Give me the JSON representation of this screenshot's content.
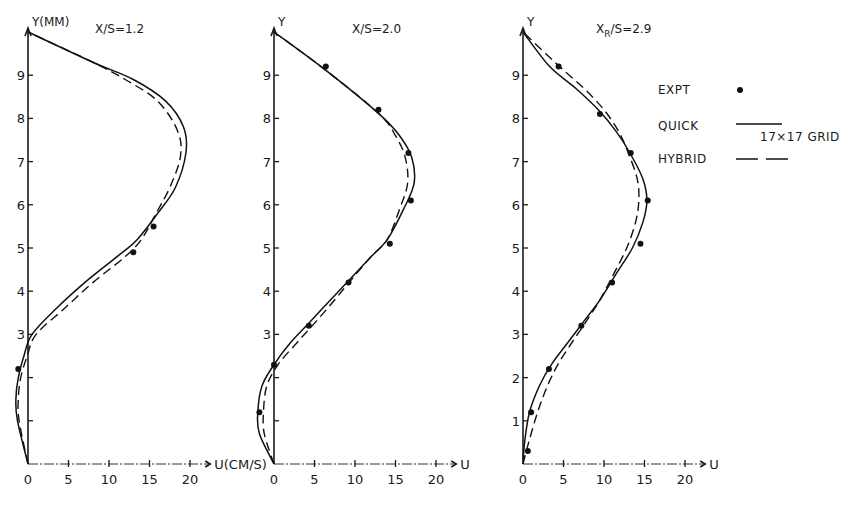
{
  "chart_data": [
    {
      "type": "line",
      "title": "X/S=1.2",
      "xlabel": "U (CM/S)",
      "ylabel": "Y(MM)",
      "x_ticks": [
        0,
        5,
        10,
        15,
        20
      ],
      "y_ticks": [
        1,
        2,
        3,
        4,
        5,
        6,
        7,
        8,
        9
      ],
      "xlim": [
        -1.5,
        22
      ],
      "ylim": [
        0,
        10
      ],
      "grid": false,
      "series": [
        {
          "name": "QUICK",
          "style": "solid",
          "points": [
            [
              0,
              0
            ],
            [
              -1.3,
              1
            ],
            [
              -1.5,
              1.5
            ],
            [
              -1.2,
              2
            ],
            [
              -0.5,
              2.5
            ],
            [
              0.5,
              3
            ],
            [
              3.5,
              3.6
            ],
            [
              7,
              4.2
            ],
            [
              11,
              4.8
            ],
            [
              13.5,
              5.2
            ],
            [
              16,
              5.8
            ],
            [
              18.2,
              6.4
            ],
            [
              19.5,
              7.2
            ],
            [
              19.2,
              7.8
            ],
            [
              17,
              8.4
            ],
            [
              13,
              8.9
            ],
            [
              8,
              9.3
            ],
            [
              0,
              10
            ]
          ]
        },
        {
          "name": "HYBRID",
          "style": "dashed",
          "points": [
            [
              0,
              0
            ],
            [
              -1.1,
              1
            ],
            [
              -1.2,
              1.5
            ],
            [
              -0.9,
              2
            ],
            [
              -0.1,
              2.5
            ],
            [
              1,
              3
            ],
            [
              4.5,
              3.6
            ],
            [
              8,
              4.2
            ],
            [
              12,
              4.8
            ],
            [
              14,
              5.2
            ],
            [
              15.8,
              5.8
            ],
            [
              17.5,
              6.4
            ],
            [
              18.8,
              7.1
            ],
            [
              18.5,
              7.7
            ],
            [
              16,
              8.4
            ],
            [
              12,
              8.9
            ],
            [
              8,
              9.3
            ],
            [
              0,
              10
            ]
          ]
        },
        {
          "name": "EXPT",
          "style": "dot",
          "points": [
            [
              -1.2,
              2.2
            ],
            [
              15.5,
              5.5
            ],
            [
              13,
              4.9
            ]
          ]
        }
      ]
    },
    {
      "type": "line",
      "title": "X/S=2.0",
      "xlabel": "U",
      "ylabel": "Y",
      "x_ticks": [
        0,
        5,
        10,
        15,
        20
      ],
      "y_ticks": [
        1,
        2,
        3,
        4,
        5,
        6,
        7,
        8,
        9
      ],
      "xlim": [
        -1.5,
        22
      ],
      "ylim": [
        0,
        10
      ],
      "grid": false,
      "series": [
        {
          "name": "QUICK",
          "style": "solid",
          "points": [
            [
              0,
              0
            ],
            [
              -1.8,
              0.7
            ],
            [
              -2,
              1.2
            ],
            [
              -1.5,
              1.8
            ],
            [
              0,
              2.3
            ],
            [
              2,
              2.8
            ],
            [
              4.5,
              3.3
            ],
            [
              7,
              3.8
            ],
            [
              9.5,
              4.3
            ],
            [
              12,
              4.8
            ],
            [
              14,
              5.2
            ],
            [
              16,
              5.9
            ],
            [
              17.3,
              6.5
            ],
            [
              17,
              7.1
            ],
            [
              15.5,
              7.6
            ],
            [
              13,
              8.1
            ],
            [
              6.5,
              9.1
            ],
            [
              0,
              10
            ]
          ]
        },
        {
          "name": "HYBRID",
          "style": "dashed",
          "points": [
            [
              0,
              0
            ],
            [
              -1.2,
              0.7
            ],
            [
              -1.3,
              1.2
            ],
            [
              -0.9,
              1.8
            ],
            [
              0.5,
              2.3
            ],
            [
              2.8,
              2.8
            ],
            [
              5.2,
              3.3
            ],
            [
              7.5,
              3.8
            ],
            [
              9.7,
              4.3
            ],
            [
              12,
              4.8
            ],
            [
              14,
              5.2
            ],
            [
              15.5,
              5.9
            ],
            [
              16.5,
              6.5
            ],
            [
              16.2,
              7.1
            ],
            [
              15,
              7.6
            ],
            [
              13,
              8.1
            ],
            [
              6.5,
              9.1
            ],
            [
              0,
              10
            ]
          ]
        },
        {
          "name": "EXPT",
          "style": "dot",
          "points": [
            [
              -1.8,
              1.2
            ],
            [
              0,
              2.3
            ],
            [
              4.3,
              3.2
            ],
            [
              9.2,
              4.2
            ],
            [
              14.3,
              5.1
            ],
            [
              16.9,
              6.1
            ],
            [
              16.6,
              7.2
            ],
            [
              12.9,
              8.2
            ],
            [
              6.4,
              9.2
            ]
          ]
        }
      ]
    },
    {
      "type": "line",
      "title": "X_R/S=2.9",
      "xlabel": "U",
      "ylabel": "Y",
      "x_ticks": [
        0,
        5,
        10,
        15,
        20
      ],
      "y_ticks": [
        1,
        2,
        3,
        4,
        5,
        6,
        7,
        8,
        9
      ],
      "xlim": [
        -1.5,
        22
      ],
      "ylim": [
        0,
        10
      ],
      "grid": false,
      "series": [
        {
          "name": "QUICK",
          "style": "solid",
          "points": [
            [
              0,
              0
            ],
            [
              0.2,
              0.5
            ],
            [
              0.8,
              1.2
            ],
            [
              2,
              1.8
            ],
            [
              3.5,
              2.3
            ],
            [
              5.5,
              2.8
            ],
            [
              7.5,
              3.3
            ],
            [
              9.5,
              3.8
            ],
            [
              11.5,
              4.4
            ],
            [
              13.5,
              5.0
            ],
            [
              14.8,
              5.6
            ],
            [
              15.3,
              6.1
            ],
            [
              14.8,
              6.6
            ],
            [
              13.2,
              7.2
            ],
            [
              11.5,
              7.7
            ],
            [
              9.3,
              8.2
            ],
            [
              6.5,
              8.7
            ],
            [
              3.3,
              9.2
            ],
            [
              0,
              10
            ]
          ]
        },
        {
          "name": "HYBRID",
          "style": "dashed",
          "points": [
            [
              0,
              0
            ],
            [
              0.7,
              0.5
            ],
            [
              1.8,
              1.2
            ],
            [
              3,
              1.8
            ],
            [
              4.3,
              2.3
            ],
            [
              6,
              2.8
            ],
            [
              7.8,
              3.3
            ],
            [
              9.5,
              3.8
            ],
            [
              11.2,
              4.4
            ],
            [
              12.8,
              5.0
            ],
            [
              13.9,
              5.6
            ],
            [
              14.3,
              6.1
            ],
            [
              14.1,
              6.6
            ],
            [
              13,
              7.2
            ],
            [
              11.8,
              7.7
            ],
            [
              10,
              8.2
            ],
            [
              7.5,
              8.7
            ],
            [
              4.5,
              9.2
            ],
            [
              0,
              10
            ]
          ]
        },
        {
          "name": "EXPT",
          "style": "dot",
          "points": [
            [
              0.6,
              0.3
            ],
            [
              1,
              1.2
            ],
            [
              3.2,
              2.2
            ],
            [
              7.2,
              3.2
            ],
            [
              11,
              4.2
            ],
            [
              14.5,
              5.1
            ],
            [
              15.4,
              6.1
            ],
            [
              13.3,
              7.2
            ],
            [
              9.5,
              8.1
            ],
            [
              4.4,
              9.2
            ]
          ]
        }
      ]
    }
  ],
  "legend": {
    "items": [
      {
        "label": "EXPT",
        "style": "dot"
      },
      {
        "label": "QUICK",
        "style": "solid"
      },
      {
        "label": "HYBRID",
        "style": "dashed"
      }
    ],
    "note": "17×17 GRID",
    "position": "right of third panel"
  },
  "panels_layout": [
    {
      "origin_x": 28,
      "px_per_unit_x": 8.1,
      "title_text": "X/S=1.2",
      "ylabel_text": "Y(MM)",
      "xlabel_text": "U(CM/S)",
      "title_x": 95
    },
    {
      "origin_x": 274,
      "px_per_unit_x": 8.1,
      "title_text": "X/S=2.0",
      "ylabel_text": "Y",
      "xlabel_text": "U",
      "title_x": 352
    },
    {
      "origin_x": 523,
      "px_per_unit_x": 8.1,
      "title_text": "XR/S=2.9",
      "ylabel_text": "Y",
      "xlabel_text": "U",
      "title_x": 596
    }
  ],
  "axis_origin_y": 464,
  "px_per_unit_y": 43.2
}
